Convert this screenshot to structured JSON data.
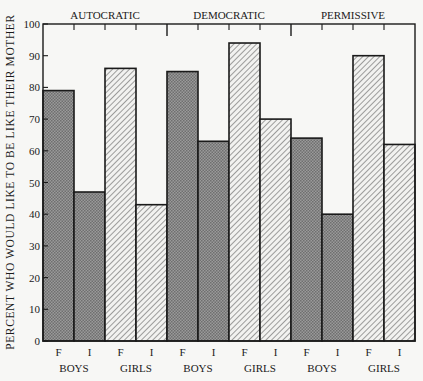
{
  "chart_data": {
    "type": "bar",
    "title": "",
    "xlabel": "",
    "ylabel": "PERCENT WHO WOULD LIKE TO BE LIKE THEIR MOTHER",
    "ylim": [
      0,
      100
    ],
    "yticks": [
      0,
      10,
      20,
      30,
      40,
      50,
      60,
      70,
      80,
      90,
      100
    ],
    "grid": false,
    "legend": "none",
    "groups": [
      "AUTOCRATIC",
      "DEMOCRATIC",
      "PERMISSIVE"
    ],
    "subgroups": [
      "BOYS",
      "GIRLS"
    ],
    "bar_labels": [
      "F",
      "I"
    ],
    "categories": [
      "AUTOCRATIC BOYS F",
      "AUTOCRATIC BOYS I",
      "AUTOCRATIC GIRLS F",
      "AUTOCRATIC GIRLS I",
      "DEMOCRATIC BOYS F",
      "DEMOCRATIC BOYS I",
      "DEMOCRATIC GIRLS F",
      "DEMOCRATIC GIRLS I",
      "PERMISSIVE BOYS F",
      "PERMISSIVE BOYS I",
      "PERMISSIVE GIRLS F",
      "PERMISSIVE GIRLS I"
    ],
    "values": [
      79,
      47,
      86,
      43,
      85,
      63,
      94,
      70,
      64,
      40,
      90,
      62
    ],
    "bars": [
      {
        "group": "AUTOCRATIC",
        "sex": "BOYS",
        "label": "F",
        "value": 79,
        "fill": "dots"
      },
      {
        "group": "AUTOCRATIC",
        "sex": "BOYS",
        "label": "I",
        "value": 47,
        "fill": "dots"
      },
      {
        "group": "AUTOCRATIC",
        "sex": "GIRLS",
        "label": "F",
        "value": 86,
        "fill": "hatch"
      },
      {
        "group": "AUTOCRATIC",
        "sex": "GIRLS",
        "label": "I",
        "value": 43,
        "fill": "hatch"
      },
      {
        "group": "DEMOCRATIC",
        "sex": "BOYS",
        "label": "F",
        "value": 85,
        "fill": "dots"
      },
      {
        "group": "DEMOCRATIC",
        "sex": "BOYS",
        "label": "I",
        "value": 63,
        "fill": "dots"
      },
      {
        "group": "DEMOCRATIC",
        "sex": "GIRLS",
        "label": "F",
        "value": 94,
        "fill": "hatch"
      },
      {
        "group": "DEMOCRATIC",
        "sex": "GIRLS",
        "label": "I",
        "value": 70,
        "fill": "hatch"
      },
      {
        "group": "PERMISSIVE",
        "sex": "BOYS",
        "label": "F",
        "value": 64,
        "fill": "dots"
      },
      {
        "group": "PERMISSIVE",
        "sex": "BOYS",
        "label": "I",
        "value": 40,
        "fill": "dots"
      },
      {
        "group": "PERMISSIVE",
        "sex": "GIRLS",
        "label": "F",
        "value": 90,
        "fill": "hatch"
      },
      {
        "group": "PERMISSIVE",
        "sex": "GIRLS",
        "label": "I",
        "value": 62,
        "fill": "hatch"
      }
    ]
  },
  "colors": {
    "background": "#f7f7f5",
    "axis": "#1a1a1a",
    "boys_fill": "#8a8a8a",
    "girls_fill": "#f2f2f0",
    "hatch_line": "#555555"
  }
}
